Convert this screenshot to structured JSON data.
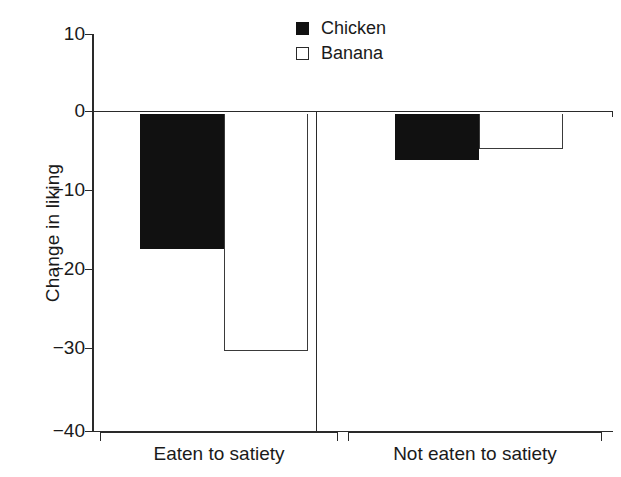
{
  "chart_data": {
    "type": "bar",
    "title": "",
    "xlabel": "",
    "ylabel": "Change in liking",
    "categories": [
      "Eaten to satiety",
      "Not eaten to satiety"
    ],
    "series": [
      {
        "name": "Chicken",
        "style": "filled",
        "values": [
          -17,
          -5.8
        ]
      },
      {
        "name": "Banana",
        "style": "open",
        "values": [
          -29.8,
          -4.5
        ]
      }
    ],
    "ylim": [
      -40,
      10
    ],
    "yticks": [
      10,
      0,
      -10,
      -20,
      -30,
      -40
    ],
    "ytick_labels": [
      "10",
      "0",
      "−10",
      "−20",
      "−30",
      "−40"
    ],
    "grid": false,
    "legend_position": "top-right",
    "zero_line": true
  },
  "legend": {
    "items": [
      {
        "label": "Chicken",
        "style": "filled"
      },
      {
        "label": "Banana",
        "style": "open"
      }
    ]
  },
  "axes": {
    "y_label": "Change in liking",
    "y_tick_labels": [
      "10",
      "0",
      "−10",
      "−20",
      "−30",
      "−40"
    ],
    "x_category_labels": [
      "Eaten to satiety",
      "Not eaten to satiety"
    ]
  },
  "colors": {
    "filled_bar": "#111111",
    "open_bar_fill": "#ffffff",
    "open_bar_stroke": "#3a3a3a",
    "axis": "#2a2a2a",
    "text": "#1a1a1a",
    "background": "#ffffff"
  }
}
